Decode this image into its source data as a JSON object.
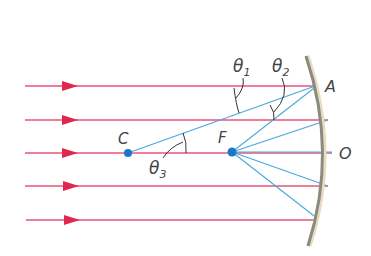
{
  "diagram": {
    "colors": {
      "incident_ray": "#e8557a",
      "arrow": "#e0284f",
      "reflected_ray": "#4aa8dc",
      "point": "#1a78c8",
      "mirror": "#8a8a80",
      "label": "#444444"
    },
    "labels": {
      "C": "C",
      "F": "F",
      "A": "A",
      "O": "O",
      "theta1": "θ",
      "theta1_sub": "1",
      "theta2": "θ",
      "theta2_sub": "2",
      "theta3": "θ",
      "theta3_sub": "3"
    },
    "points": {
      "C": {
        "x": 128,
        "y": 153,
        "label": "C",
        "meaning": "center of curvature"
      },
      "F": {
        "x": 232,
        "y": 152,
        "label": "F",
        "meaning": "focal point"
      },
      "A": {
        "x": 318,
        "y": 84,
        "label": "A"
      },
      "O": {
        "x": 332,
        "y": 152,
        "label": "O"
      }
    },
    "incident_rays": [
      {
        "y": 86,
        "x_start": 25,
        "x_end": 318
      },
      {
        "y": 120,
        "x_start": 25,
        "x_end": 328
      },
      {
        "y": 153,
        "x_start": 25,
        "x_end": 332
      },
      {
        "y": 186,
        "x_start": 25,
        "x_end": 328
      },
      {
        "y": 220,
        "x_start": 25,
        "x_end": 318
      }
    ],
    "angles": [
      "θ1 between incident ray and radius CA",
      "θ2 between radius CA and reflected ray AF",
      "θ3 between radius CA and axis"
    ]
  }
}
